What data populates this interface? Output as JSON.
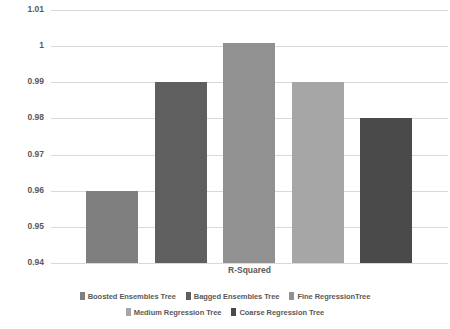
{
  "chart_data": {
    "type": "bar",
    "title": "",
    "xlabel": "R-Squared",
    "ylabel": "",
    "categories": [
      "R-Squared"
    ],
    "ylim": [
      0.94,
      1.01
    ],
    "y_ticks": [
      1.01,
      1,
      0.99,
      0.98,
      0.97,
      0.96,
      0.95,
      0.94
    ],
    "y_tick_labels": [
      "1.01",
      "1",
      "0.99",
      "0.98",
      "0.97",
      "0.96",
      "0.95",
      "0.94"
    ],
    "grid": true,
    "legend_position": "bottom",
    "series": [
      {
        "name": "Boosted Ensembles Tree",
        "value": 0.96,
        "color": "#7f7f7f"
      },
      {
        "name": "Bagged Ensembles Tree",
        "value": 0.99,
        "color": "#5f5f5f"
      },
      {
        "name": "Fine RegressionTree",
        "value": 1.001,
        "color": "#919191"
      },
      {
        "name": "Medium Regression Tree",
        "value": 0.99,
        "color": "#a6a6a6"
      },
      {
        "name": "Coarse Regression Tree",
        "value": 0.98,
        "color": "#4a4a4a"
      }
    ]
  },
  "axis": {
    "category_label": "R-Squared"
  },
  "legend": {
    "rows": [
      [
        "Boosted Ensembles Tree",
        "Bagged Ensembles Tree",
        "Fine RegressionTree"
      ],
      [
        "Medium Regression Tree",
        "Coarse Regression Tree"
      ]
    ]
  },
  "colors": {
    "gridline": "#d9d9d9",
    "text": "#595959",
    "background": "#ffffff"
  }
}
